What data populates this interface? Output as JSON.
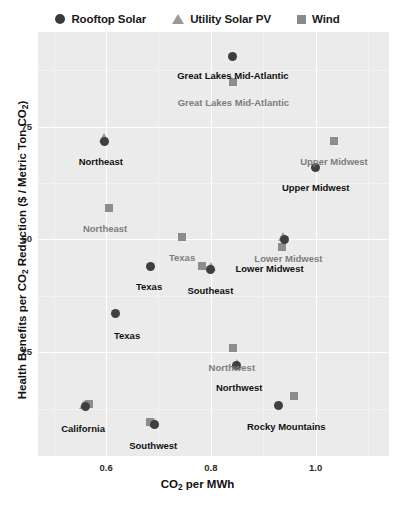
{
  "legend": {
    "items": [
      {
        "label": "Rooftop Solar",
        "marker": "circle-icon",
        "color": "#3b3b3b"
      },
      {
        "label": "Utility Solar PV",
        "marker": "triangle-icon",
        "color": "#9a9a9a"
      },
      {
        "label": "Wind",
        "marker": "square-icon",
        "color": "#8a8a8a"
      }
    ]
  },
  "axes": {
    "x_title_main": "CO",
    "x_title_sub": "2",
    "x_title_tail": " per MWh",
    "y_title_a": "Health Benefits per CO",
    "y_title_sub1": "2",
    "y_title_b": " Reduction ($ / Metric Ton CO",
    "y_title_sub2": "2",
    "y_title_c": ")",
    "x_ticks": [
      "0.6",
      "0.8",
      "1.0"
    ],
    "y_ticks": [
      "25",
      "50",
      "75"
    ]
  },
  "chart_data": {
    "type": "scatter",
    "title": "",
    "xlabel": "CO2 per MWh",
    "ylabel": "Health Benefits per CO2 Reduction ($ / Metric Ton CO2)",
    "xlim": [
      0.47,
      1.14
    ],
    "ylim": [
      2,
      96
    ],
    "xticks": [
      0.6,
      0.8,
      1.0
    ],
    "yticks": [
      25,
      50,
      75
    ],
    "grid": true,
    "legend_position": "top-center",
    "panel_color": "#ebebeb",
    "series": [
      {
        "name": "Rooftop Solar",
        "marker": "circle",
        "color": "#3f3f3f",
        "label_color": "#111111",
        "points": [
          {
            "region": "Great Lakes Mid-Atlantic",
            "x": 0.842,
            "y": 90.5
          },
          {
            "region": "Northeast",
            "x": 0.596,
            "y": 71.8
          },
          {
            "region": "Upper Midwest",
            "x": 1.0,
            "y": 66.0
          },
          {
            "region": "Lower Midwest",
            "x": 0.94,
            "y": 50.0
          },
          {
            "region": "Texas",
            "x": 0.685,
            "y": 44.0
          },
          {
            "region": "Southeast",
            "x": 0.8,
            "y": 43.3
          },
          {
            "region": "Northwest",
            "x": 0.849,
            "y": 22.0
          },
          {
            "region": "California",
            "x": 0.56,
            "y": 13.0
          },
          {
            "region": "Southwest",
            "x": 0.693,
            "y": 9.0
          },
          {
            "region": "Rocky Mountains",
            "x": 0.93,
            "y": 13.2
          }
        ]
      },
      {
        "name": "Utility Solar PV",
        "marker": "triangle",
        "color": "#9e9e9e",
        "label_color": "#7d7d7d",
        "points": [
          {
            "region": "Northeast",
            "x": 0.596,
            "y": 72.4
          },
          {
            "region": "Lower Midwest",
            "x": 0.938,
            "y": 50.6
          },
          {
            "region": "Southeast",
            "x": 0.8,
            "y": 43.8
          },
          {
            "region": "Northwest",
            "x": 0.849,
            "y": 22.5
          },
          {
            "region": "California",
            "x": 0.558,
            "y": 13.4
          },
          {
            "region": "Southwest",
            "x": 0.691,
            "y": 9.4
          }
        ]
      },
      {
        "name": "Wind",
        "marker": "square",
        "color": "#8d8d8d",
        "label_color": "#7d7d7d",
        "points": [
          {
            "region": "Great Lakes Mid-Atlantic",
            "x": 0.843,
            "y": 85.0
          },
          {
            "region": "Upper Midwest",
            "x": 1.035,
            "y": 71.8
          },
          {
            "region": "Northeast",
            "x": 0.605,
            "y": 57.0
          },
          {
            "region": "Texas",
            "x": 0.745,
            "y": 50.5
          },
          {
            "region": "Lower Midwest",
            "x": 0.935,
            "y": 48.4
          },
          {
            "region": "Southeast",
            "x": 0.783,
            "y": 44.2
          },
          {
            "region": "Northwest",
            "x": 0.842,
            "y": 26.0
          },
          {
            "region": "California",
            "x": 0.567,
            "y": 13.5
          },
          {
            "region": "Southwest",
            "x": 0.684,
            "y": 9.6
          },
          {
            "region": "Rocky Mountains",
            "x": 0.958,
            "y": 15.3
          }
        ]
      }
    ],
    "point_labels": [
      {
        "text": "Great Lakes Mid-Atlantic",
        "x": 0.842,
        "y": 87.6,
        "style": "dark"
      },
      {
        "text": "Great Lakes Mid-Atlantic",
        "x": 0.843,
        "y": 81.5,
        "style": "gray"
      },
      {
        "text": "Northeast",
        "x": 0.59,
        "y": 68.5,
        "style": "dark"
      },
      {
        "text": "Upper Midwest",
        "x": 1.035,
        "y": 68.4,
        "style": "gray"
      },
      {
        "text": "Upper Midwest",
        "x": 1.0,
        "y": 62.7,
        "style": "dark"
      },
      {
        "text": "Northeast",
        "x": 0.598,
        "y": 53.6,
        "style": "gray"
      },
      {
        "text": "Texas",
        "x": 0.745,
        "y": 47.2,
        "style": "gray"
      },
      {
        "text": "Lower Midwest",
        "x": 0.948,
        "y": 47.0,
        "style": "gray"
      },
      {
        "text": "Lower Midwest",
        "x": 0.912,
        "y": 44.8,
        "style": "dark"
      },
      {
        "text": "Texas",
        "x": 0.682,
        "y": 40.7,
        "style": "dark"
      },
      {
        "text": "Southeast",
        "x": 0.799,
        "y": 39.8,
        "style": "dark"
      },
      {
        "text": "Texas",
        "x": 0.64,
        "y": 30.0,
        "style": "dark"
      },
      {
        "text": "Northwest",
        "x": 0.84,
        "y": 22.8,
        "style": "gray"
      },
      {
        "text": "Northwest",
        "x": 0.854,
        "y": 18.4,
        "style": "dark"
      },
      {
        "text": "Rocky Mountains",
        "x": 0.944,
        "y": 9.7,
        "style": "dark"
      },
      {
        "text": "California",
        "x": 0.556,
        "y": 9.4,
        "style": "dark"
      },
      {
        "text": "Southwest",
        "x": 0.69,
        "y": 5.5,
        "style": "dark"
      }
    ],
    "extra_points": [
      {
        "series": "Rooftop Solar",
        "region": "Texas",
        "x": 0.617,
        "y": 33.5,
        "marker": "circle"
      }
    ]
  }
}
